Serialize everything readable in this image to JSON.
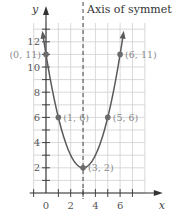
{
  "chart_data": {
    "type": "line",
    "title": "",
    "function": "y = (x - 3)^2 + 2",
    "xlabel": "x",
    "ylabel": "y",
    "xlim": [
      -1,
      8
    ],
    "ylim": [
      0,
      13.5
    ],
    "grid": true,
    "x_ticks": [
      0,
      2,
      4,
      6
    ],
    "y_ticks": [
      2,
      4,
      6,
      8,
      10,
      12
    ],
    "x_tick_labels": [
      "0",
      "2",
      "4",
      "6"
    ],
    "y_tick_labels": [
      "2",
      "4",
      "6",
      "8",
      "10",
      "12"
    ],
    "curve_x_range": [
      -0.25,
      6.25
    ],
    "points": [
      {
        "x": 0,
        "y": 11,
        "label": "(0, 11)",
        "label_side": "left"
      },
      {
        "x": 1,
        "y": 6,
        "label": "(1, 6)",
        "label_side": "right"
      },
      {
        "x": 3,
        "y": 2,
        "label": "(3, 2)",
        "label_side": "right"
      },
      {
        "x": 5,
        "y": 6,
        "label": "(5, 6)",
        "label_side": "right"
      },
      {
        "x": 6,
        "y": 11,
        "label": "(6, 11)",
        "label_side": "right"
      }
    ],
    "annotations": [
      {
        "type": "vertical-dashed-line",
        "x": 3,
        "label": "Axis of symmetry"
      }
    ],
    "colors": {
      "curve": "#5a5a5a",
      "grid": "#cfcfcf",
      "axis": "#333333",
      "point": "#6b6b6b"
    }
  }
}
